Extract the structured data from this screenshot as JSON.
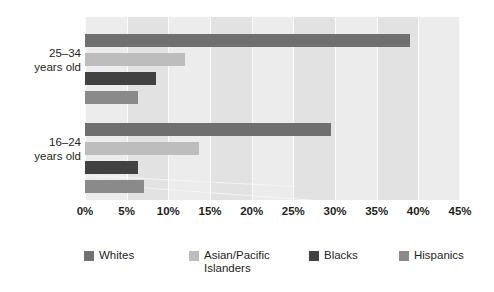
{
  "chart_data": {
    "type": "bar",
    "orientation": "horizontal",
    "title": "",
    "xlabel": "",
    "ylabel": "",
    "xlim": [
      0,
      45
    ],
    "xticks": [
      "0%",
      "5%",
      "10%",
      "15%",
      "20%",
      "25%",
      "30%",
      "35%",
      "40%",
      "45%"
    ],
    "xtick_values": [
      0,
      5,
      10,
      15,
      20,
      25,
      30,
      35,
      40,
      45
    ],
    "grid": true,
    "legend_position": "bottom",
    "categories": [
      "25–34\nyears old",
      "16–24\nyears old"
    ],
    "series": [
      {
        "name": "Whites",
        "color": "#6f6f6f",
        "values": [
          39.0,
          29.5
        ]
      },
      {
        "name": "Asian/Pacific\nIslanders",
        "color": "#bdbdbd",
        "values": [
          12.0,
          13.7
        ]
      },
      {
        "name": "Blacks",
        "color": "#414141",
        "values": [
          8.5,
          6.3
        ]
      },
      {
        "name": "Hispanics",
        "color": "#8a8a8a",
        "values": [
          6.3,
          7.1
        ]
      }
    ]
  },
  "axis": {
    "category_labels": [
      {
        "line1": "25–34",
        "line2": "years old"
      },
      {
        "line1": "16–24",
        "line2": "years old"
      }
    ],
    "ticks": [
      {
        "label": "0%",
        "value": 0
      },
      {
        "label": "5%",
        "value": 5
      },
      {
        "label": "10%",
        "value": 10
      },
      {
        "label": "15%",
        "value": 15
      },
      {
        "label": "20%",
        "value": 20
      },
      {
        "label": "25%",
        "value": 25
      },
      {
        "label": "30%",
        "value": 30
      },
      {
        "label": "35%",
        "value": 35
      },
      {
        "label": "40%",
        "value": 40
      },
      {
        "label": "45%",
        "value": 45
      }
    ]
  },
  "legend": {
    "items": [
      {
        "label": "Whites",
        "color": "#6f6f6f"
      },
      {
        "label": "Asian/Pacific\nIslanders",
        "color": "#bdbdbd"
      },
      {
        "label": "Blacks",
        "color": "#414141"
      },
      {
        "label": "Hispanics",
        "color": "#8a8a8a"
      }
    ]
  },
  "colors": {
    "plot_background": "#e9e9e9",
    "band_light": "#ececec",
    "band_dark": "#e2e2e2",
    "gridline": "#fbfbfb",
    "text": "#231f20"
  }
}
